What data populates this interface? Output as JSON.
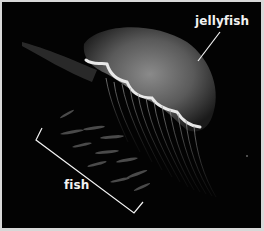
{
  "image": {
    "subject": "moon jellyfish with small fish swimming beneath it",
    "background_color": "#030303",
    "border_color": "#d8d8d8",
    "annotation_color": "#f2f2f2"
  },
  "annotations": [
    {
      "label": "jellyfish",
      "marker": "pointer-line"
    },
    {
      "label": "fish",
      "marker": "bracket"
    }
  ]
}
